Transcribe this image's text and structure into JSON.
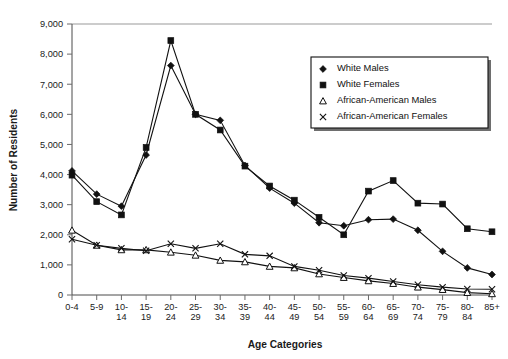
{
  "chart_data": {
    "type": "line",
    "title": "",
    "xlabel": "Age Categories",
    "ylabel": "Number of Residents",
    "ylim": [
      0,
      9000
    ],
    "ytick_step": 1000,
    "grid": false,
    "legend_position": "upper-right",
    "categories": [
      "0-4",
      "5-9",
      "10-14",
      "15-19",
      "20-24",
      "25-29",
      "30-34",
      "35-39",
      "40-44",
      "45-49",
      "50-54",
      "55-59",
      "60-64",
      "65-69",
      "70-74",
      "75-79",
      "80-84",
      "85+"
    ],
    "ytick_labels": [
      "0",
      "1,000",
      "2,000",
      "3,000",
      "4,000",
      "5,000",
      "6,000",
      "7,000",
      "8,000",
      "9,000"
    ],
    "ytick_values": [
      0,
      1000,
      2000,
      3000,
      4000,
      5000,
      6000,
      7000,
      8000,
      9000
    ],
    "series": [
      {
        "name": "White Males",
        "marker": "diamond-filled",
        "values": [
          4120,
          3350,
          2950,
          4650,
          7620,
          6000,
          5800,
          4300,
          3550,
          3050,
          2400,
          2300,
          2500,
          2520,
          2150,
          1450,
          900,
          680
        ]
      },
      {
        "name": "White Females",
        "marker": "square-filled",
        "values": [
          3980,
          3100,
          2660,
          4900,
          8450,
          6000,
          5480,
          4280,
          3620,
          3150,
          2580,
          2000,
          3450,
          3800,
          3050,
          3020,
          2200,
          2100
        ]
      },
      {
        "name": "African-American Males",
        "marker": "triangle-open",
        "values": [
          2150,
          1650,
          1500,
          1500,
          1420,
          1320,
          1150,
          1100,
          950,
          900,
          700,
          580,
          470,
          380,
          260,
          180,
          80,
          40
        ]
      },
      {
        "name": "African-American Females",
        "marker": "x",
        "values": [
          1850,
          1650,
          1550,
          1470,
          1700,
          1550,
          1700,
          1350,
          1300,
          950,
          820,
          650,
          560,
          450,
          340,
          260,
          200,
          190
        ]
      }
    ]
  },
  "legend": {
    "entries": [
      {
        "label": "White Males",
        "marker": "diamond-filled"
      },
      {
        "label": "White Females",
        "marker": "square-filled"
      },
      {
        "label": "African-American Males",
        "marker": "triangle-open"
      },
      {
        "label": "African-American Females",
        "marker": "x"
      }
    ]
  },
  "colors": {
    "ink": "#111111",
    "axis": "#4a4a4a",
    "background": "#ffffff"
  }
}
